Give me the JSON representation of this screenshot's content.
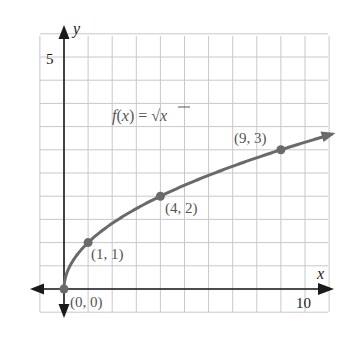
{
  "chart_data": {
    "type": "line",
    "title": "",
    "function_label": "f(x) = √x",
    "function_label_parts": {
      "lhs": "f(x) = ",
      "radical": "√",
      "radicand": "x"
    },
    "xlabel": "x",
    "ylabel": "y",
    "xlim": [
      -1,
      11
    ],
    "ylim": [
      -0.5,
      5.5
    ],
    "x_ticks": [
      {
        "value": 10,
        "label": "10"
      }
    ],
    "y_ticks": [
      {
        "value": 5,
        "label": "5"
      }
    ],
    "grid": true,
    "grid_spacing": {
      "x": 1,
      "y": 0.5
    },
    "series": [
      {
        "name": "f(x) = √x",
        "function": "sqrt",
        "x_range": [
          0,
          11.1
        ],
        "color": "#6a6a6a",
        "arrow_end": true
      }
    ],
    "points": [
      {
        "x": 0,
        "y": 0,
        "label": "(0, 0)"
      },
      {
        "x": 1,
        "y": 1,
        "label": "(1, 1)"
      },
      {
        "x": 4,
        "y": 2,
        "label": "(4, 2)"
      },
      {
        "x": 9,
        "y": 3,
        "label": "(9, 3)"
      }
    ],
    "colors": {
      "curve": "#6a6a6a",
      "axis": "#1a1a1a",
      "grid": "#c8c8c8"
    }
  }
}
